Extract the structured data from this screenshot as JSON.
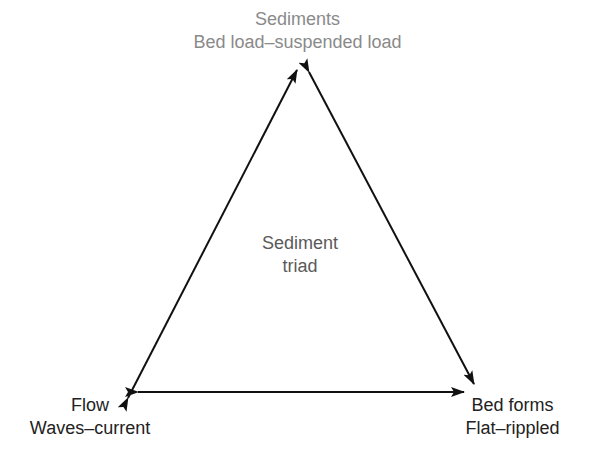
{
  "diagram": {
    "title": "Sediment triad",
    "nodes": [
      {
        "id": "top",
        "title": "Sediments",
        "subtitle": "Bed load–suspended load",
        "color": "#8a8a8a"
      },
      {
        "id": "left",
        "title": "Flow",
        "subtitle": "Waves–current",
        "color": "#222222"
      },
      {
        "id": "right",
        "title": "Bed forms",
        "subtitle": "Flat–rippled",
        "color": "#222222"
      }
    ],
    "center": {
      "line1": "Sediment",
      "line2": "triad"
    },
    "edges": [
      {
        "from": "left",
        "to": "top",
        "bidirectional": true
      },
      {
        "from": "top",
        "to": "right",
        "bidirectional": true
      },
      {
        "from": "left",
        "to": "right",
        "bidirectional": true
      }
    ],
    "arrow_color": "#111111"
  }
}
